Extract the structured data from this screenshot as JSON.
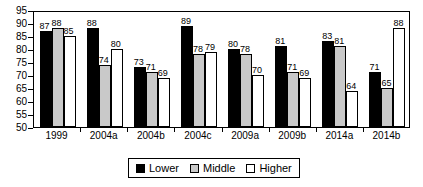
{
  "chart_data": {
    "type": "bar",
    "title": "",
    "subtitle": "",
    "xlabel": "",
    "ylabel": "",
    "ylim": [
      50,
      95
    ],
    "yticks": [
      50,
      55,
      60,
      65,
      70,
      75,
      80,
      85,
      90,
      95
    ],
    "ytick_labels": [
      "50",
      "55",
      "60",
      "65",
      "70",
      "75",
      "80",
      "85",
      "90",
      "95"
    ],
    "grid": false,
    "legend_position": "bottom-center",
    "categories": [
      "1999",
      "2004a",
      "2004b",
      "2004c",
      "2009a",
      "2009b",
      "2014a",
      "2014b"
    ],
    "series": [
      {
        "name": "Lower",
        "color": "#000000",
        "values": [
          87,
          88,
          73,
          89,
          80,
          81,
          83,
          71
        ],
        "value_labels": [
          "87",
          "88",
          "73",
          "89",
          "80",
          "81",
          "83",
          "71"
        ]
      },
      {
        "name": "Middle",
        "color": "#c9c9c9",
        "values": [
          88,
          74,
          71,
          78,
          78,
          71,
          81,
          65
        ],
        "value_labels": [
          "88",
          "74",
          "71",
          "78",
          "78",
          "71",
          "81",
          "65"
        ]
      },
      {
        "name": "Higher",
        "color": "#ffffff",
        "values": [
          85,
          80,
          69,
          79,
          70,
          69,
          64,
          88
        ],
        "value_labels": [
          "85",
          "80",
          "69",
          "79",
          "70",
          "69",
          "64",
          "88"
        ]
      }
    ],
    "data_by_group": [
      {
        "category": "1999",
        "Lower": 87,
        "Middle": 88,
        "Higher": 85
      },
      {
        "category": "2004a",
        "Lower": 88,
        "Middle": 74,
        "Higher": 80
      },
      {
        "category": "2004b",
        "Lower": 73,
        "Middle": 71,
        "Higher": 69
      },
      {
        "category": "2004c",
        "Lower": 89,
        "Middle": 78,
        "Higher": 79
      },
      {
        "category": "2009a",
        "Lower": 80,
        "Middle": 78,
        "Higher": 70
      },
      {
        "category": "2009b",
        "Lower": 81,
        "Middle": 71,
        "Higher": 69
      },
      {
        "category": "2014a",
        "Lower": 83,
        "Middle": 81,
        "Higher": 64
      },
      {
        "category": "2014b",
        "Lower": 71,
        "Middle": 65,
        "Higher": 88
      }
    ]
  },
  "legend": {
    "items": [
      {
        "label": "Lower",
        "color": "#000000"
      },
      {
        "label": "Middle",
        "color": "#c9c9c9"
      },
      {
        "label": "Higher",
        "color": "#ffffff"
      }
    ]
  }
}
